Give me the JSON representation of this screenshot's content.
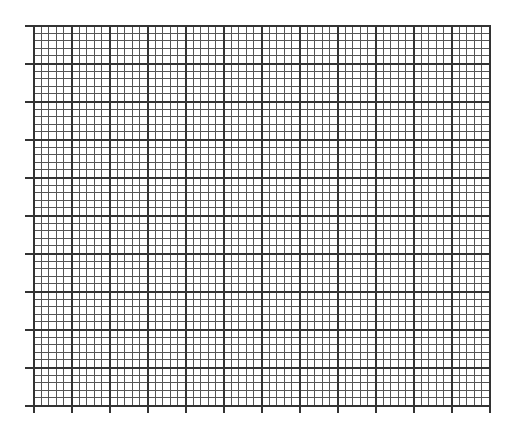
{
  "graph_paper": {
    "origin_x": 33,
    "origin_y": 25,
    "major_cols": 12,
    "major_rows": 10,
    "major_size": 38,
    "minor_per_major": 5,
    "tick_length": 8,
    "colors": {
      "background": "#ffffff",
      "major_line": "#333333",
      "minor_line": "#555555"
    }
  }
}
